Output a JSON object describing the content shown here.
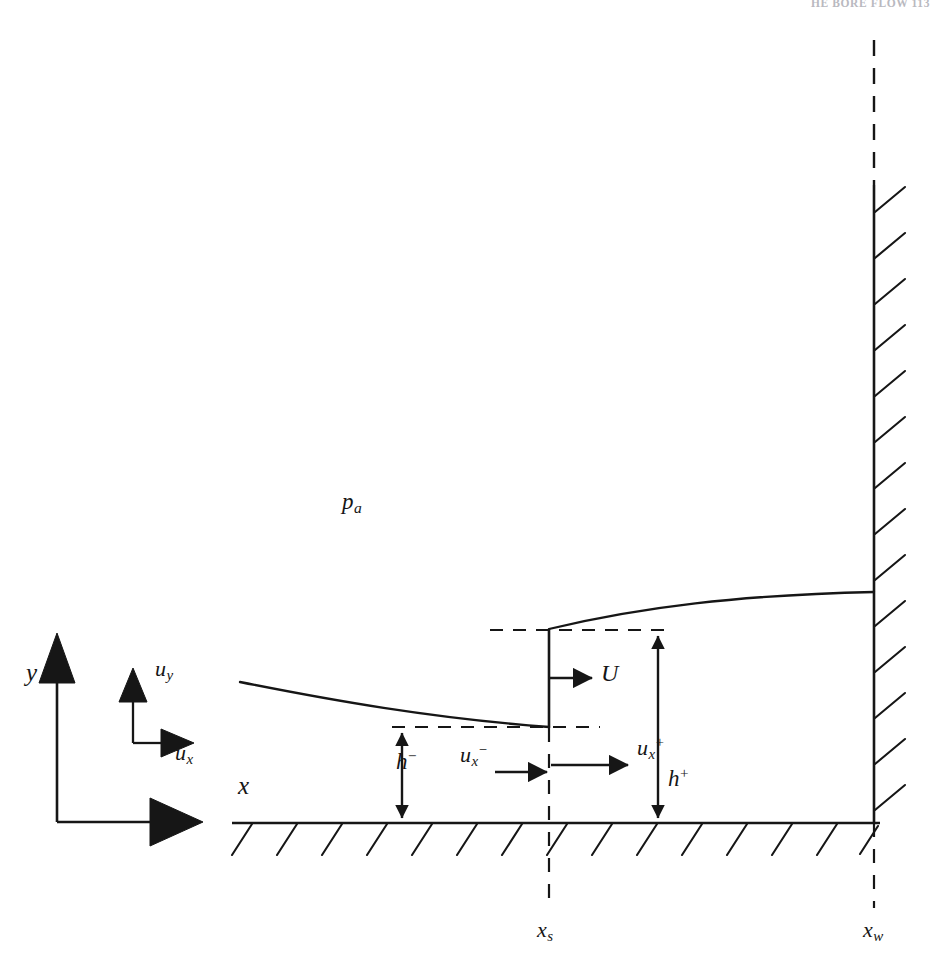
{
  "page": {
    "running_head": "HE BORE FLOW   113",
    "background_color": "#ffffff",
    "ink_color": "#161616",
    "width": 948,
    "height": 970
  },
  "figure": {
    "axes": {
      "origin_label_x": "x",
      "origin_label_y": "y",
      "velocity_label_x": "u",
      "velocity_label_x_sub": "x",
      "velocity_label_y": "u",
      "velocity_label_y_sub": "y"
    },
    "labels": {
      "ambient_pressure": "p",
      "ambient_pressure_sub": "a",
      "bore_speed": "U",
      "depth_upstream": "h",
      "depth_upstream_sup": "−",
      "depth_downstream": "h",
      "depth_downstream_sup": "+",
      "velocity_upstream": "u",
      "velocity_upstream_sub": "x",
      "velocity_upstream_sup": "−",
      "velocity_downstream": "u",
      "velocity_downstream_sub": "x",
      "velocity_downstream_sup": "+",
      "station_shock": "x",
      "station_shock_sub": "s",
      "station_wall": "x",
      "station_wall_sub": "w"
    },
    "geometry": {
      "bed_y": 823,
      "bed_x_start": 232,
      "bed_x_end": 880,
      "wall_x": 874,
      "wall_y_top": 40,
      "wall_solid_from_y": 185,
      "shock_x": 549,
      "crest_y": 630,
      "trough_y": 727,
      "free_surface_upstream_start_x": 240,
      "free_surface_upstream_start_y": 682,
      "free_surface_downstream_end_y": 592
    }
  }
}
